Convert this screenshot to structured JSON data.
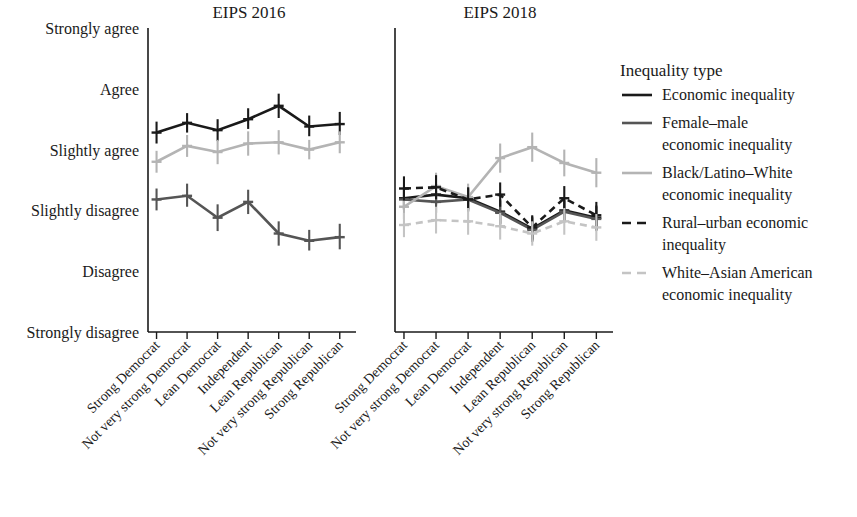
{
  "figure": {
    "panels": [
      {
        "id": "eips2016",
        "title": "EIPS 2016"
      },
      {
        "id": "eips2018",
        "title": "EIPS 2018"
      }
    ],
    "legend": {
      "title": "Inequality type",
      "entries": [
        {
          "label": "Economic inequality",
          "color": "#1a1a1a",
          "dash": "none",
          "width": 2.6
        },
        {
          "label": "Female–male economic inequality",
          "color": "#555555",
          "dash": "none",
          "width": 2.6
        },
        {
          "label": "Black/Latino–White economic inequality",
          "color": "#b4b4b4",
          "dash": "none",
          "width": 2.6
        },
        {
          "label": "Rural–urban economic inequality",
          "color": "#1a1a1a",
          "dash": "dashed",
          "width": 2.6
        },
        {
          "label": "White–Asian American economic inequality",
          "color": "#c4c4c4",
          "dash": "dashed",
          "width": 2.6
        }
      ]
    }
  },
  "chart_data": {
    "type": "line",
    "title": "",
    "xlabel": "",
    "ylabel": "",
    "grid": false,
    "legend_position": "right",
    "categories": [
      "Strong Democrat",
      "Not very strong Democrat",
      "Lean Democrat",
      "Independent",
      "Lean Republican",
      "Not very strong Republican",
      "Strong Republican"
    ],
    "y_tick_labels": [
      "Strongly agree",
      "Agree",
      "Slightly agree",
      "Slightly disagree",
      "Disagree",
      "Strongly disagree"
    ],
    "y_tick_values": [
      6,
      5,
      4,
      3,
      2,
      1
    ],
    "ylim": [
      1,
      6
    ],
    "panels": [
      {
        "name": "EIPS 2016",
        "series": [
          {
            "name": "Economic inequality",
            "color": "#1a1a1a",
            "dash": "none",
            "values": [
              4.28,
              4.44,
              4.32,
              4.5,
              4.72,
              4.38,
              4.42
            ],
            "err_low": [
              4.1,
              4.28,
              4.14,
              4.34,
              4.52,
              4.22,
              4.24
            ],
            "err_high": [
              4.46,
              4.6,
              4.5,
              4.68,
              4.92,
              4.56,
              4.62
            ]
          },
          {
            "name": "Female–male economic inequality",
            "color": "#555555",
            "dash": "none",
            "values": [
              3.18,
              3.24,
              2.88,
              3.14,
              2.62,
              2.5,
              2.56
            ],
            "err_low": [
              3.0,
              3.06,
              2.66,
              2.94,
              2.42,
              2.34,
              2.36
            ],
            "err_high": [
              3.36,
              3.44,
              3.1,
              3.34,
              2.82,
              2.68,
              2.78
            ]
          },
          {
            "name": "Black/Latino–White economic inequality",
            "color": "#b4b4b4",
            "dash": "none",
            "values": [
              3.8,
              4.06,
              3.96,
              4.1,
              4.12,
              4.0,
              4.12
            ],
            "err_low": [
              3.62,
              3.88,
              3.76,
              3.9,
              3.92,
              3.84,
              3.94
            ],
            "err_high": [
              3.98,
              4.24,
              4.16,
              4.3,
              4.32,
              4.16,
              4.3
            ]
          }
        ]
      },
      {
        "name": "EIPS 2018",
        "series": [
          {
            "name": "Economic inequality",
            "color": "#1a1a1a",
            "dash": "none",
            "values": [
              3.2,
              3.26,
              3.2,
              2.98,
              2.7,
              3.0,
              2.88
            ],
            "err_low": [
              3.02,
              3.08,
              3.02,
              2.78,
              2.5,
              2.82,
              2.68
            ],
            "err_high": [
              3.38,
              3.44,
              3.38,
              3.18,
              2.9,
              3.18,
              3.08
            ]
          },
          {
            "name": "Female–male economic inequality",
            "color": "#555555",
            "dash": "none",
            "values": [
              3.18,
              3.14,
              3.18,
              2.96,
              2.68,
              2.98,
              2.86
            ],
            "err_low": [
              3.0,
              2.96,
              3.0,
              2.76,
              2.48,
              2.8,
              2.66
            ],
            "err_high": [
              3.36,
              3.32,
              3.36,
              3.16,
              2.88,
              3.16,
              3.06
            ]
          },
          {
            "name": "Black/Latino–White economic inequality",
            "color": "#b4b4b4",
            "dash": "none",
            "values": [
              3.06,
              3.4,
              3.22,
              3.86,
              4.04,
              3.78,
              3.62
            ],
            "err_low": [
              2.86,
              3.18,
              3.0,
              3.62,
              3.8,
              3.56,
              3.38
            ],
            "err_high": [
              3.26,
              3.62,
              3.44,
              4.1,
              4.28,
              4.0,
              3.86
            ]
          },
          {
            "name": "Rural–urban economic inequality",
            "color": "#1a1a1a",
            "dash": "dashed",
            "values": [
              3.36,
              3.38,
              3.18,
              3.26,
              2.72,
              3.2,
              2.92
            ],
            "err_low": [
              3.16,
              3.18,
              2.98,
              3.06,
              2.52,
              3.0,
              2.7
            ],
            "err_high": [
              3.56,
              3.58,
              3.38,
              3.46,
              2.92,
              3.4,
              3.14
            ]
          },
          {
            "name": "White–Asian American economic inequality",
            "color": "#c4c4c4",
            "dash": "dashed",
            "values": [
              2.76,
              2.84,
              2.82,
              2.74,
              2.62,
              2.82,
              2.72
            ],
            "err_low": [
              2.56,
              2.62,
              2.6,
              2.52,
              2.42,
              2.6,
              2.5
            ],
            "err_high": [
              2.96,
              3.06,
              3.04,
              2.96,
              2.82,
              3.04,
              2.94
            ]
          }
        ]
      }
    ]
  }
}
